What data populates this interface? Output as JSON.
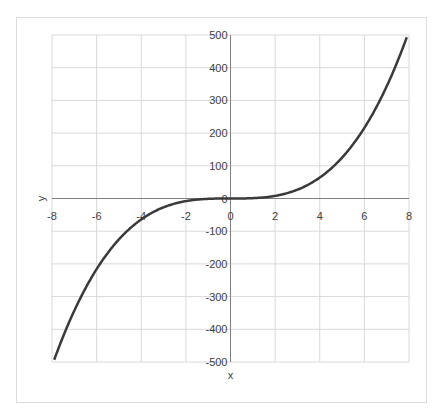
{
  "chart_data": {
    "type": "line",
    "title": "",
    "function": "y = x^3",
    "xlabel": "x",
    "ylabel": "y",
    "xlim": [
      -8,
      8
    ],
    "ylim": [
      -500,
      500
    ],
    "grid": true,
    "legend": null,
    "x_ticks": [
      "-8",
      "-6",
      "-4",
      "-2",
      "0",
      "2",
      "4",
      "6",
      "8"
    ],
    "y_ticks": [
      "500",
      "400",
      "300",
      "200",
      "100",
      "0",
      "-100",
      "-200",
      "-300",
      "-400",
      "-500"
    ],
    "series": [
      {
        "name": "y",
        "color": "#3a3a3a",
        "x": [
          -8,
          -7,
          -6,
          -5,
          -4,
          -3,
          -2,
          -1,
          0,
          1,
          2,
          3,
          4,
          5,
          6,
          7,
          8
        ],
        "y": [
          -512,
          -343,
          -216,
          -125,
          -64,
          -27,
          -8,
          -1,
          0,
          1,
          8,
          27,
          64,
          125,
          216,
          343,
          512
        ]
      }
    ]
  },
  "colors": {
    "curve": "#3a3a3a",
    "grid": "#d9d9d9",
    "axis": "#808080",
    "frame": "#dcdcdc",
    "text": "#404040"
  }
}
